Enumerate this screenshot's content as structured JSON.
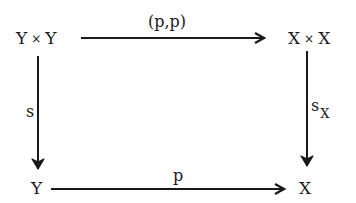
{
  "diagram": {
    "type": "commutative-square",
    "nodes": {
      "top_left": {
        "left": "Y",
        "op": "×",
        "right": "Y"
      },
      "top_right": {
        "left": "X",
        "op": "×",
        "right": "X"
      },
      "bottom_left": {
        "text": "Y"
      },
      "bottom_right": {
        "text": "X"
      }
    },
    "arrows": {
      "top": {
        "label": "(p,p)",
        "from": "Y × Y",
        "to": "X × X"
      },
      "left": {
        "label": "s",
        "from": "Y × Y",
        "to": "Y"
      },
      "right": {
        "label_main": "s",
        "label_sub": "X",
        "from": "X × X",
        "to": "X"
      },
      "bottom": {
        "label": "p",
        "from": "Y",
        "to": "X"
      }
    },
    "colors": {
      "ink": "#1a1a1a",
      "background": "#ffffff"
    }
  }
}
